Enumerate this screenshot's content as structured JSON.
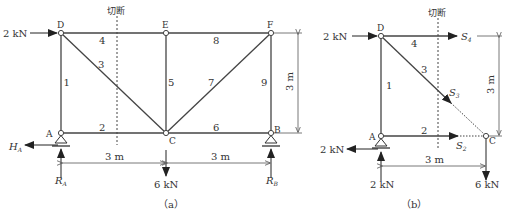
{
  "figure_a": {
    "caption": "（a）",
    "cut_label": "切断",
    "nodes": {
      "A": "A",
      "B": "B",
      "C": "C",
      "D": "D",
      "E": "E",
      "F": "F"
    },
    "members": {
      "m1": "1",
      "m2": "2",
      "m3": "3",
      "m4": "4",
      "m5": "5",
      "m6": "6",
      "m7": "7",
      "m8": "8",
      "m9": "9"
    },
    "load_D": "2 kN",
    "load_C": "6 kN",
    "reaction_HA": "H",
    "reaction_HA_sub": "A",
    "reaction_RA": "R",
    "reaction_RA_sub": "A",
    "reaction_RB": "R",
    "reaction_RB_sub": "B",
    "dim_left": "3 m",
    "dim_right": "3 m",
    "dim_height": "3 m"
  },
  "figure_b": {
    "caption": "（b）",
    "cut_label": "切断",
    "nodes": {
      "A": "A",
      "C": "C",
      "D": "D"
    },
    "members": {
      "m1": "1",
      "m2": "2",
      "m3": "3",
      "m4": "4"
    },
    "load_D": "2 kN",
    "load_A_horizontal": "2 kN",
    "load_A_vertical": "2 kN",
    "load_C": "6 kN",
    "force_S4": "S",
    "force_S4_sub": "4",
    "force_S3": "S",
    "force_S3_sub": "3",
    "force_S2": "S",
    "force_S2_sub": "2",
    "dim_width": "3 m",
    "dim_height": "3 m"
  },
  "colors": {
    "line": "#333333",
    "dim": "#555555",
    "background": "#ffffff"
  }
}
